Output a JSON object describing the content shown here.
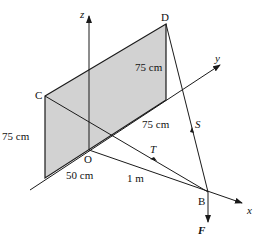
{
  "diagram": {
    "points": {
      "O": "O",
      "B": "B",
      "C": "C",
      "D": "D"
    },
    "axes": {
      "x": "x",
      "y": "y",
      "z": "z"
    },
    "forces": {
      "S": "S",
      "T": "T",
      "F": "F"
    },
    "dimensions": {
      "plate_height_left": "75 cm",
      "plate_height_right": "75 cm",
      "plate_width": "75 cm",
      "offset_x": "50 cm",
      "OB": "1 m"
    },
    "colors": {
      "plate": "#d2d2d2",
      "line": "#1a1a1a"
    }
  }
}
